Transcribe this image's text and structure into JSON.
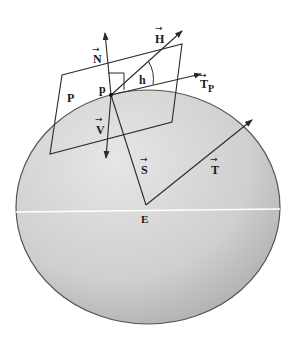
{
  "figure": {
    "colors": {
      "line": "#2a2a2a",
      "sphere_light": "#e2e2e2",
      "sphere_dark": "#a9a9a9",
      "equator": "#ffffff",
      "background": "#ffffff"
    },
    "labels": {
      "N": "N",
      "H": "H",
      "h": "h",
      "T_P": "T",
      "T_P_sub": "P",
      "P_plane": "P",
      "p_point": "p",
      "V": "V",
      "S": "S",
      "T": "T",
      "E": "E"
    },
    "vector_marker": "→"
  }
}
